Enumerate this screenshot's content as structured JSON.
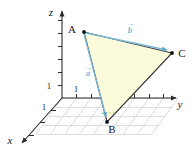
{
  "figure": {
    "background_color": "#ffffff"
  },
  "axes": {
    "x": {
      "label": "x",
      "tick_unit_label": "1"
    },
    "y": {
      "label": "y",
      "tick_unit_label": "1"
    },
    "z": {
      "label": "z",
      "tick_unit_label": "1"
    },
    "axis_color": "#2b2b2b",
    "tick_color": "#2b2b2b"
  },
  "grid": {
    "color": "#c9c9c9",
    "columns": 8,
    "rows": 4
  },
  "points": [
    {
      "name": "A",
      "label": "A",
      "cx": 84,
      "cy": 32
    },
    {
      "name": "B",
      "label": "B",
      "cx": 107,
      "cy": 122
    },
    {
      "name": "C",
      "label": "C",
      "cx": 172,
      "cy": 53
    }
  ],
  "triangle": {
    "fill_color": "#fbfbdc",
    "stroke_color": "#3a3a3a"
  },
  "vectors": [
    {
      "name": "a",
      "label": "a",
      "from": "A",
      "to": "B",
      "color": "#7ab8d9"
    },
    {
      "name": "b",
      "label": "b",
      "from": "A",
      "to": "C",
      "color": "#7ab8d9"
    }
  ]
}
